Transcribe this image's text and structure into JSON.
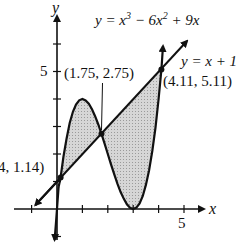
{
  "figure": {
    "axes": {
      "x_label": "x",
      "y_label": "y",
      "x_tick_label": "5",
      "y_tick_label": "5"
    },
    "curve_label": {
      "prefix": "y = x",
      "exp1": "3",
      "mid": " − 6x",
      "exp2": "2",
      "suffix": " + 9x"
    },
    "line_label": "y = x + 1",
    "points": [
      {
        "label": "4, 1.14)",
        "x": 0.14,
        "y": 1.14
      },
      {
        "label": "(1.75, 2.75)",
        "x": 1.75,
        "y": 2.75
      },
      {
        "label": "(4.11, 5.11)",
        "x": 4.11,
        "y": 5.11
      }
    ],
    "colors": {
      "stroke": "#111111",
      "shade": "#cfcfcf"
    }
  }
}
